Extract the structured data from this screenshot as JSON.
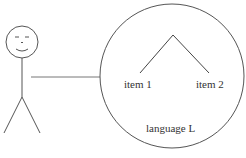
{
  "diagram": {
    "items": [
      "item 1",
      "item 2"
    ],
    "circle_label": "language L",
    "stroke_color": "#555555"
  }
}
